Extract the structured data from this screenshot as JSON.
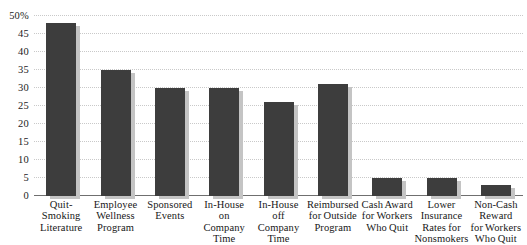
{
  "chart_data": {
    "type": "bar",
    "title": "",
    "subtitle": "",
    "xlabel": "",
    "ylabel": "",
    "ylim": [
      0,
      50
    ],
    "y_unit": "%",
    "grid": true,
    "legend": "none",
    "orientation": "vertical",
    "y_ticks": [
      {
        "value": 50,
        "label": "50%"
      },
      {
        "value": 45,
        "label": "45"
      },
      {
        "value": 40,
        "label": "40"
      },
      {
        "value": 35,
        "label": "35"
      },
      {
        "value": 30,
        "label": "30"
      },
      {
        "value": 25,
        "label": "25"
      },
      {
        "value": 20,
        "label": "20"
      },
      {
        "value": 15,
        "label": "15"
      },
      {
        "value": 10,
        "label": "10"
      },
      {
        "value": 5,
        "label": "5"
      },
      {
        "value": 0,
        "label": "0"
      }
    ],
    "categories": [
      "Quit-\nSmoking\nLiterature",
      "Employee\nWellness\nProgram",
      "Sponsored\nEvents",
      "In-House\non\nCompany\nTime",
      "In-House\noff\nCompany\nTime",
      "Reimbursed\nfor Outside\nProgram",
      "Cash Award\nfor Workers\nWho Quit",
      "Lower\nInsurance\nRates for\nNonsmokers",
      "Non-Cash\nReward\nfor Workers\nWho Quit"
    ],
    "values": [
      48,
      35,
      30,
      30,
      26,
      31,
      5,
      5,
      3
    ],
    "colors": {
      "bar": "#3d3d3d",
      "bar_shadow": "#c4c4c4",
      "gridline": "#c9c9c9",
      "axis": "#6f6f6f",
      "text": "#1a1a1a",
      "background": "#ffffff"
    }
  }
}
